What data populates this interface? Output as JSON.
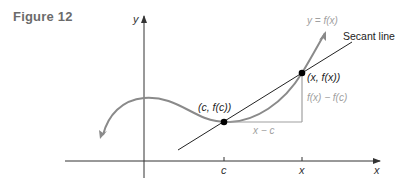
{
  "figure": {
    "label": "Figure 12"
  },
  "axes": {
    "x_label": "x",
    "y_label": "y"
  },
  "ticks": {
    "c": "c",
    "x": "x"
  },
  "annotations": {
    "curve_label": "y = f(x)",
    "secant_label": "Secant line",
    "point_c": "(c, f(c))",
    "point_x": "(x, f(x))",
    "rise": "f(x) − f(c)",
    "run": "x − c"
  },
  "colors": {
    "curve": "#8a8a8a",
    "secant": "#222222",
    "axis": "#333333",
    "gray_text": "#a0a0a0",
    "dark_text": "#222222",
    "point": "#000000"
  }
}
